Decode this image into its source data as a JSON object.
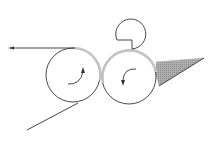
{
  "diagram": {
    "title": "",
    "colors": {
      "line": "#333333",
      "coating": "#c4c4c4",
      "wedge_fill": "#9a9a9a",
      "background": "#ffffff"
    },
    "components": [
      {
        "id": "left-roll",
        "type": "roller",
        "rotation": "clockwise"
      },
      {
        "id": "right-roll",
        "type": "roller",
        "rotation": "counterclockwise"
      },
      {
        "id": "top-roll",
        "type": "small-roller"
      },
      {
        "id": "outgoing-web",
        "type": "line-with-arrow",
        "direction": "left"
      },
      {
        "id": "incoming-web",
        "type": "line"
      },
      {
        "id": "coating-pool",
        "type": "shaded-wedge"
      }
    ]
  }
}
